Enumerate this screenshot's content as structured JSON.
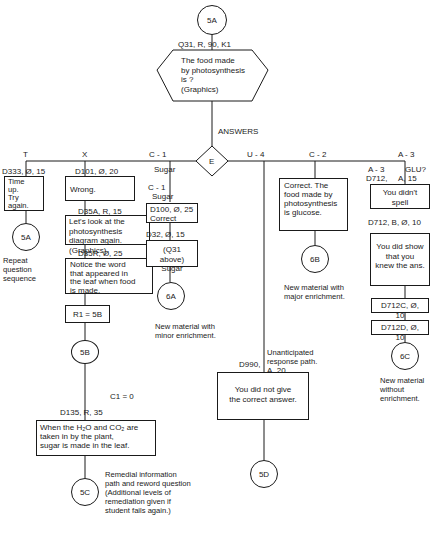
{
  "start": {
    "node": "5A",
    "code": "Q31, R, 90, K1",
    "question": "The food made\nby photosynthesis\nis             ?\n(Graphics)"
  },
  "answers_label": "ANSWERS",
  "decision": "E",
  "branches": {
    "T": {
      "label": "T",
      "code": "D333,  Ø, 15",
      "text": "Time\nup.\nTry\nagain.",
      "target": "5A",
      "caption": "Repeat\nquestion\nsequence"
    },
    "X": {
      "label": "X",
      "code1": "D101,  Ø, 20",
      "box1": "Wrong.",
      "code2": "D35A,        R, 15",
      "box2": "Let's look at the\nphotosynthesis\ndiagram again.\n(Graphics)",
      "code3": "D35R,        Ø, 25",
      "box3": "Notice the word\nthat appeared in\nthe leaf when food\nis made.",
      "box4": "R1 = 5B",
      "node": "5B",
      "code4": "D135,  R,   35",
      "cond": "C1 = 0",
      "box5": "When the H₂O and CO₂ are\ntaken in by the plant,\nsugar is made in the leaf.",
      "target": "5C",
      "caption": "Remedial information\npath and reword question\n(Additional levels of\nremediation given if\nstudent fails again.)"
    },
    "C1": {
      "label": "C - 1",
      "sub": "Sugar",
      "label2": "C - 1",
      "sub2": "Sugar",
      "code1": "D100,  Ø, 25",
      "box1": "Correct",
      "code2": "D32,  Ø,  15",
      "box2": "(Q31 above)\nSugar",
      "target": "6A",
      "caption": "New material with\nminor enrichment."
    },
    "U4": {
      "label": "U - 4",
      "caption": "Unanticipated\nresponse path.",
      "code": "D990,",
      "code_b": "A, 20",
      "box": "You did not give\nthe correct answer.",
      "target": "5D"
    },
    "C2": {
      "label": "C - 2",
      "sub": "Glucose",
      "label2": "C - 2",
      "sub2": "Glucose",
      "box": "Correct.  The\nfood made by\nphotosynthesis\nis glucose.",
      "target": "6B",
      "caption": "New material with\nmajor enrichment."
    },
    "A3": {
      "label": "A - 3",
      "label2": "A - 3",
      "glu": "GLU?",
      "code1": "D712,",
      "code1b": "A, 15",
      "box1": "You didn't\nspell",
      "code2": "D712,  B, Ø, 10",
      "box2": "You did show\nthat you\nknew the ans.",
      "box3": "D712C, Ø, 10",
      "box4": "D712D, Ø, 10",
      "target": "6C",
      "caption": "New material\nwithout\nenrichment."
    }
  }
}
